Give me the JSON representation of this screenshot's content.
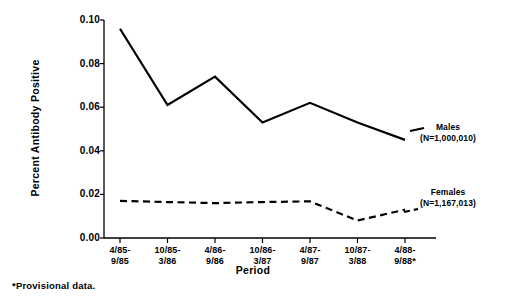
{
  "chart_data": {
    "type": "line",
    "title": "",
    "xlabel": "Period",
    "ylabel": "Percent Antibody Positive",
    "categories": [
      "4/85-\n9/85",
      "10/85-\n3/86",
      "4/86-\n9/86",
      "10/86-\n3/87",
      "4/87-\n9/87",
      "10/87-\n3/88",
      "4/88-\n9/88*"
    ],
    "category_lines": [
      [
        "4/85-",
        "9/85"
      ],
      [
        "10/85-",
        "3/86"
      ],
      [
        "4/86-",
        "9/86"
      ],
      [
        "10/86-",
        "3/87"
      ],
      [
        "4/87-",
        "9/87"
      ],
      [
        "10/87-",
        "3/88"
      ],
      [
        "4/88-",
        "9/88*"
      ]
    ],
    "ylim": [
      0.0,
      0.1
    ],
    "yticks": [
      0.0,
      0.02,
      0.04,
      0.06,
      0.08,
      0.1
    ],
    "ytick_labels": [
      "0.00",
      "0.02",
      "0.04",
      "0.06",
      "0.08",
      "0.10"
    ],
    "grid": false,
    "legend_position": "right-inline-annotations",
    "series": [
      {
        "name": "Males",
        "n_label": "(N=1,000,010)",
        "style": "solid",
        "color": "#000000",
        "values": [
          0.096,
          0.061,
          0.074,
          0.053,
          0.062,
          0.053,
          0.045
        ]
      },
      {
        "name": "Females",
        "n_label": "(N=1,167,013)",
        "style": "dashed",
        "color": "#000000",
        "values": [
          0.017,
          0.0165,
          0.016,
          0.0165,
          0.0168,
          0.008,
          0.013
        ]
      }
    ],
    "footnote": "*Provisional data."
  },
  "axis": {
    "ylabel": "Percent Antibody Positive",
    "xlabel": "Period"
  },
  "annotations": {
    "males": {
      "name": "Males",
      "n_label": "(N=1,000,010)"
    },
    "females": {
      "name": "Females",
      "n_label": "(N=1,167,013)"
    }
  },
  "footnote": "*Provisional data."
}
